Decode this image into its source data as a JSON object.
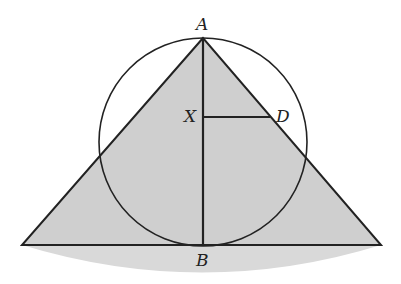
{
  "diagram": {
    "type": "geometry",
    "labels": {
      "A": "A",
      "B": "B",
      "X": "X",
      "D": "D"
    },
    "points": {
      "A": [
        203,
        38
      ],
      "B": [
        203,
        245
      ],
      "X": [
        203,
        117
      ],
      "D": [
        270,
        117
      ],
      "left_base": [
        22,
        245
      ],
      "right_base": [
        381,
        245
      ]
    },
    "circle": {
      "center": [
        203,
        142
      ],
      "radius": 104
    },
    "colors": {
      "fill": "#cfcfcf",
      "shadow": "#d6d6d6",
      "stroke": "#222222",
      "background": "#ffffff"
    }
  }
}
